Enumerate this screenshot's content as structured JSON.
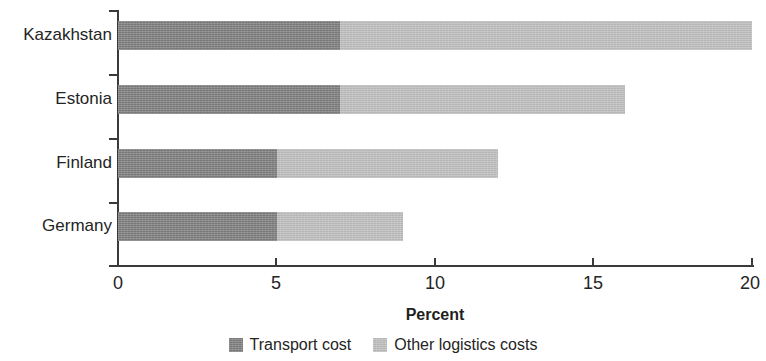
{
  "chart_data": {
    "type": "bar",
    "orientation": "horizontal",
    "stacked": true,
    "title": "",
    "subtitle": "",
    "xlabel": "Percent",
    "ylabel": "",
    "categories": [
      "Kazakhstan",
      "Estonia",
      "Finland",
      "Germany"
    ],
    "series": [
      {
        "name": "Transport cost",
        "color": "#7c7c7c",
        "values": [
          7,
          7,
          5,
          5
        ]
      },
      {
        "name": "Other logistics costs",
        "color": "#bcbcbc",
        "values": [
          13,
          9,
          7,
          4
        ]
      }
    ],
    "totals": [
      20,
      16,
      12,
      9
    ],
    "xlim": [
      0,
      20
    ],
    "xticks": [
      0,
      5,
      10,
      15,
      20
    ],
    "xtick_labels": [
      "0",
      "5",
      "10",
      "15",
      "20"
    ],
    "grid": false,
    "legend_position": "bottom"
  },
  "axis": {
    "x_title": "Percent",
    "tick_labels": [
      "0",
      "5",
      "10",
      "15",
      "20"
    ]
  },
  "categories": [
    {
      "label": "Kazakhstan"
    },
    {
      "label": "Estonia"
    },
    {
      "label": "Finland"
    },
    {
      "label": "Germany"
    }
  ],
  "legend": {
    "items": [
      {
        "label": "Transport cost",
        "color": "#7c7c7c"
      },
      {
        "label": "Other logistics costs",
        "color": "#bcbcbc"
      }
    ]
  },
  "colors": {
    "transport_cost": "#7c7c7c",
    "other_logistics_costs": "#bcbcbc",
    "axis": "#3a3a3a",
    "text": "#242424",
    "background": "#ffffff"
  }
}
